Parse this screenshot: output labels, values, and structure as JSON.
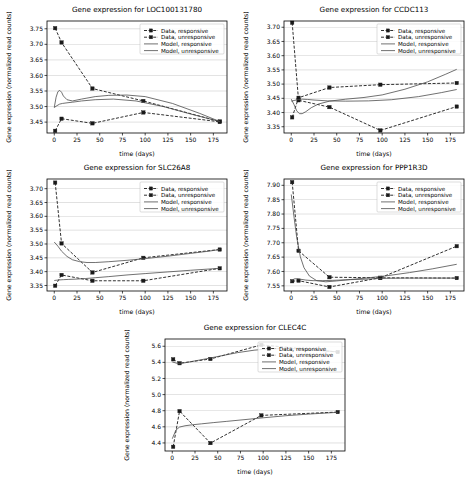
{
  "figure": {
    "width": 473,
    "height": 480,
    "background": "#ffffff",
    "panel_count": 5
  },
  "common": {
    "xlabel": "time (days)",
    "ylabel": "Gene expression (normalized read counts)",
    "xlim": [
      -8,
      190
    ],
    "xticks": [
      0,
      25,
      50,
      75,
      100,
      125,
      150,
      175
    ],
    "legend": [
      {
        "label": "Data, responsive",
        "style": "dashed-marker",
        "color": "#1a1a1a"
      },
      {
        "label": "Data, unresponsive",
        "style": "dashed-marker",
        "color": "#1a1a1a"
      },
      {
        "label": "Model, responsive",
        "style": "solid",
        "color": "#4d4d4d"
      },
      {
        "label": "Model, unresponsive",
        "style": "solid",
        "color": "#4d4d4d"
      }
    ],
    "legend_position": "upper right",
    "grid": true,
    "grid_axis": "y"
  },
  "chart_data": [
    {
      "id": "loc100131780",
      "type": "line",
      "title": "Gene expression for LOC100131780",
      "xlabel": "time (days)",
      "ylabel": "Gene expression (normalized read counts)",
      "xlim": [
        -8,
        190
      ],
      "ylim": [
        3.415,
        3.775
      ],
      "xticks": [
        0,
        25,
        50,
        75,
        100,
        125,
        150,
        175
      ],
      "yticks": [
        3.45,
        3.5,
        3.55,
        3.6,
        3.65,
        3.7,
        3.75
      ],
      "series": [
        {
          "name": "Data, responsive",
          "x": [
            1,
            8,
            42,
            98,
            182
          ],
          "values": [
            3.752,
            3.706,
            3.558,
            3.518,
            3.452
          ]
        },
        {
          "name": "Data, unresponsive",
          "x": [
            1,
            8,
            42,
            98,
            182
          ],
          "values": [
            3.422,
            3.461,
            3.446,
            3.481,
            3.451
          ]
        },
        {
          "name": "Model, responsive",
          "x": [
            0,
            3,
            6,
            9,
            14,
            20,
            30,
            45,
            65,
            90,
            120,
            150,
            182
          ],
          "values": [
            3.497,
            3.503,
            3.508,
            3.51,
            3.512,
            3.514,
            3.518,
            3.522,
            3.524,
            3.518,
            3.5,
            3.476,
            3.452
          ]
        },
        {
          "name": "Model, unresponsive",
          "x": [
            0,
            2,
            4,
            6,
            8,
            10,
            14,
            20,
            30,
            45,
            60,
            80,
            100,
            130,
            160,
            182
          ],
          "values": [
            3.497,
            3.53,
            3.548,
            3.552,
            3.546,
            3.534,
            3.522,
            3.518,
            3.524,
            3.532,
            3.536,
            3.537,
            3.532,
            3.51,
            3.478,
            3.452
          ]
        }
      ]
    },
    {
      "id": "ccdc113",
      "type": "line",
      "title": "Gene expression for CCDC113",
      "xlabel": "time (days)",
      "ylabel": "Gene expression (normalized read counts)",
      "xlim": [
        -8,
        190
      ],
      "ylim": [
        3.328,
        3.722
      ],
      "xticks": [
        0,
        25,
        50,
        75,
        100,
        125,
        150,
        175
      ],
      "yticks": [
        3.35,
        3.4,
        3.45,
        3.5,
        3.55,
        3.6,
        3.65,
        3.7
      ],
      "series": [
        {
          "name": "Data, responsive",
          "x": [
            1,
            8,
            42,
            98,
            182
          ],
          "values": [
            3.383,
            3.452,
            3.488,
            3.498,
            3.504
          ]
        },
        {
          "name": "Data, unresponsive",
          "x": [
            1,
            8,
            42,
            98,
            182
          ],
          "values": [
            3.716,
            3.443,
            3.419,
            3.337,
            3.421
          ]
        },
        {
          "name": "Model, responsive",
          "x": [
            0,
            4,
            8,
            12,
            18,
            25,
            40,
            60,
            85,
            110,
            140,
            165,
            182
          ],
          "values": [
            3.44,
            3.443,
            3.446,
            3.447,
            3.446,
            3.444,
            3.441,
            3.44,
            3.441,
            3.445,
            3.456,
            3.47,
            3.481
          ]
        },
        {
          "name": "Model, unresponsive",
          "x": [
            0,
            3,
            6,
            9,
            12,
            16,
            22,
            30,
            42,
            60,
            80,
            100,
            125,
            150,
            170,
            182
          ],
          "values": [
            3.447,
            3.428,
            3.406,
            3.396,
            3.396,
            3.403,
            3.417,
            3.43,
            3.44,
            3.447,
            3.453,
            3.462,
            3.482,
            3.508,
            3.535,
            3.552
          ]
        }
      ]
    },
    {
      "id": "slc26a8",
      "type": "line",
      "title": "Gene expression for SLC26A8",
      "xlabel": "time (days)",
      "ylabel": "Gene expression (normalized read counts)",
      "xlim": [
        -8,
        190
      ],
      "ylim": [
        3.33,
        3.735
      ],
      "xticks": [
        0,
        25,
        50,
        75,
        100,
        125,
        150,
        175
      ],
      "yticks": [
        3.35,
        3.4,
        3.45,
        3.5,
        3.55,
        3.6,
        3.65,
        3.7
      ],
      "series": [
        {
          "name": "Data, responsive",
          "x": [
            1,
            8,
            42,
            98,
            182
          ],
          "values": [
            3.722,
            3.502,
            3.397,
            3.45,
            3.48
          ]
        },
        {
          "name": "Data, unresponsive",
          "x": [
            1,
            8,
            42,
            98,
            182
          ],
          "values": [
            3.349,
            3.388,
            3.367,
            3.367,
            3.412
          ]
        },
        {
          "name": "Model, responsive",
          "x": [
            0,
            5,
            10,
            16,
            24,
            34,
            45,
            60,
            80,
            100,
            125,
            150,
            182
          ],
          "values": [
            3.368,
            3.37,
            3.371,
            3.372,
            3.373,
            3.375,
            3.378,
            3.382,
            3.388,
            3.393,
            3.399,
            3.405,
            3.412
          ]
        },
        {
          "name": "Model, unresponsive",
          "x": [
            0,
            4,
            8,
            14,
            20,
            28,
            36,
            45,
            60,
            80,
            100,
            125,
            150,
            170,
            182
          ],
          "values": [
            3.507,
            3.492,
            3.474,
            3.455,
            3.443,
            3.436,
            3.433,
            3.433,
            3.436,
            3.441,
            3.447,
            3.456,
            3.466,
            3.474,
            3.48
          ]
        }
      ]
    },
    {
      "id": "ppp1r3d",
      "type": "line",
      "title": "Gene expression for PPP1R3D",
      "xlabel": "time (days)",
      "ylabel": "Gene expression (normalized read counts)",
      "xlim": [
        -8,
        190
      ],
      "ylim": [
        7.532,
        7.922
      ],
      "xticks": [
        0,
        25,
        50,
        75,
        100,
        125,
        150,
        175
      ],
      "yticks": [
        7.55,
        7.6,
        7.65,
        7.7,
        7.75,
        7.8,
        7.85,
        7.9
      ],
      "series": [
        {
          "name": "Data, responsive",
          "x": [
            1,
            8,
            42,
            98,
            182
          ],
          "values": [
            7.911,
            7.672,
            7.58,
            7.578,
            7.688
          ]
        },
        {
          "name": "Data, unresponsive",
          "x": [
            1,
            8,
            42,
            98,
            182
          ],
          "values": [
            7.566,
            7.568,
            7.546,
            7.578,
            7.577
          ]
        },
        {
          "name": "Model, responsive",
          "x": [
            0,
            3,
            6,
            10,
            16,
            24,
            34,
            45,
            60,
            80,
            100,
            125,
            150,
            182
          ],
          "values": [
            7.566,
            7.574,
            7.575,
            7.573,
            7.57,
            7.568,
            7.568,
            7.569,
            7.571,
            7.573,
            7.576,
            7.577,
            7.577,
            7.577
          ]
        },
        {
          "name": "Model, unresponsive",
          "x": [
            0,
            3,
            6,
            10,
            14,
            20,
            28,
            38,
            50,
            65,
            85,
            105,
            130,
            155,
            182
          ],
          "values": [
            7.868,
            7.79,
            7.718,
            7.651,
            7.613,
            7.584,
            7.568,
            7.564,
            7.567,
            7.572,
            7.578,
            7.585,
            7.596,
            7.609,
            7.625
          ]
        }
      ]
    },
    {
      "id": "clec4c",
      "type": "line",
      "title": "Gene expression for CLEC4C",
      "xlabel": "time (days)",
      "ylabel": "Gene expression (normalized read counts)",
      "xlim": [
        -8,
        190
      ],
      "ylim": [
        4.3,
        5.69
      ],
      "xticks": [
        0,
        25,
        50,
        75,
        100,
        125,
        150,
        175
      ],
      "yticks": [
        4.4,
        4.6,
        4.8,
        5.0,
        5.2,
        5.4,
        5.6
      ],
      "series": [
        {
          "name": "Data, responsive",
          "x": [
            1,
            8,
            42,
            98,
            182
          ],
          "values": [
            4.352,
            4.795,
            4.398,
            4.742,
            4.783
          ]
        },
        {
          "name": "Data, unresponsive",
          "x": [
            1,
            8,
            42,
            98,
            182
          ],
          "values": [
            5.438,
            5.389,
            5.442,
            5.617,
            5.528
          ]
        },
        {
          "name": "Model, responsive",
          "x": [
            0,
            4,
            8,
            14,
            22,
            32,
            45,
            60,
            80,
            100,
            125,
            150,
            182
          ],
          "values": [
            4.452,
            4.56,
            4.597,
            4.613,
            4.625,
            4.637,
            4.652,
            4.668,
            4.69,
            4.712,
            4.738,
            4.758,
            4.78
          ]
        },
        {
          "name": "Model, unresponsive",
          "x": [
            0,
            6,
            14,
            25,
            40,
            55,
            72,
            90,
            105,
            120,
            140,
            160,
            182
          ],
          "values": [
            5.405,
            5.386,
            5.395,
            5.418,
            5.45,
            5.484,
            5.521,
            5.551,
            5.566,
            5.572,
            5.568,
            5.552,
            5.53
          ]
        }
      ]
    }
  ],
  "panel_layout": [
    {
      "id": "loc100131780",
      "left": 0,
      "top": 0,
      "width": 236,
      "height": 160
    },
    {
      "id": "ccdc113",
      "left": 237,
      "top": 0,
      "width": 236,
      "height": 160
    },
    {
      "id": "slc26a8",
      "left": 0,
      "top": 158,
      "width": 236,
      "height": 160
    },
    {
      "id": "ppp1r3d",
      "left": 237,
      "top": 158,
      "width": 236,
      "height": 160
    },
    {
      "id": "clec4c",
      "left": 118,
      "top": 318,
      "width": 236,
      "height": 160
    }
  ]
}
